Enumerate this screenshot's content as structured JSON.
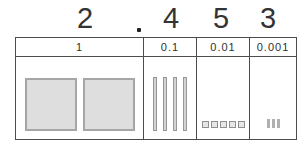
{
  "number": {
    "value": "2.453",
    "ones_digit": "2",
    "decimal_point": ".",
    "tenths_digit": "4",
    "hundredths_digit": "5",
    "thousandths_digit": "3"
  },
  "place_value_table": {
    "columns": [
      {
        "header": "1",
        "blocks": {
          "type": "flat-square",
          "count": 2
        }
      },
      {
        "header": "0.1",
        "blocks": {
          "type": "rod",
          "count": 4
        }
      },
      {
        "header": "0.01",
        "blocks": {
          "type": "small-square",
          "count": 5
        }
      },
      {
        "header": "0.001",
        "blocks": {
          "type": "tiny-rod",
          "count": 3
        }
      }
    ]
  },
  "colors": {
    "background": "#ffffff",
    "grid_line": "#4c4c4c",
    "digit_text": "#333333",
    "flat_fill": "#dedede",
    "flat_border": "#a6a6a6",
    "rod_fill": "#d2d2d2",
    "small_square_fill": "#e6e6e6",
    "tiny_rod_fill": "#b0b0b0"
  }
}
